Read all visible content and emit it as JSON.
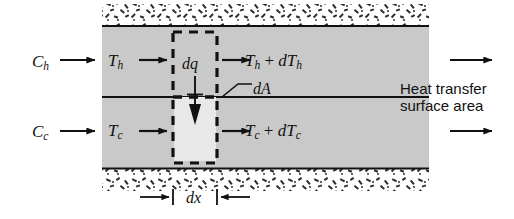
{
  "figure": {
    "kind": "heat-exchanger-differential-element"
  },
  "colors": {
    "channel_fill": "#c9c9c9",
    "control_volume_fill": "#e4e4e4",
    "line": "#111111",
    "insulation_speck": "#2b2b2b",
    "background": "#ffffff"
  },
  "labels": {
    "hot_capacity": {
      "base": "C",
      "sub": "h"
    },
    "cold_capacity": {
      "base": "C",
      "sub": "c"
    },
    "hot_inlet_temp": {
      "base": "T",
      "sub": "h"
    },
    "cold_inlet_temp": {
      "base": "T",
      "sub": "c"
    },
    "hot_outlet_temp": {
      "base": "T",
      "sub": "h",
      "op": " + ",
      "base2": "dT",
      "sub2": "h"
    },
    "cold_outlet_temp": {
      "base": "T",
      "sub": "c",
      "op": " + ",
      "base2": "dT",
      "sub2": "c"
    },
    "heat_increment": "dq",
    "area_increment": "dA",
    "length_increment": "dx",
    "surface_area_line1": "Heat transfer",
    "surface_area_line2": "surface area"
  },
  "geometry": {
    "body_left": 102,
    "body_right": 429,
    "hot_top": 26,
    "wall_y": 97,
    "cold_bottom": 168,
    "insulation_top_y": 4,
    "insulation_bottom_y": 169,
    "insulation_height": 22,
    "cv_left": 172,
    "cv_right": 218,
    "cv_top": 32,
    "cv_bottom": 163,
    "dx_line_y": 197
  }
}
